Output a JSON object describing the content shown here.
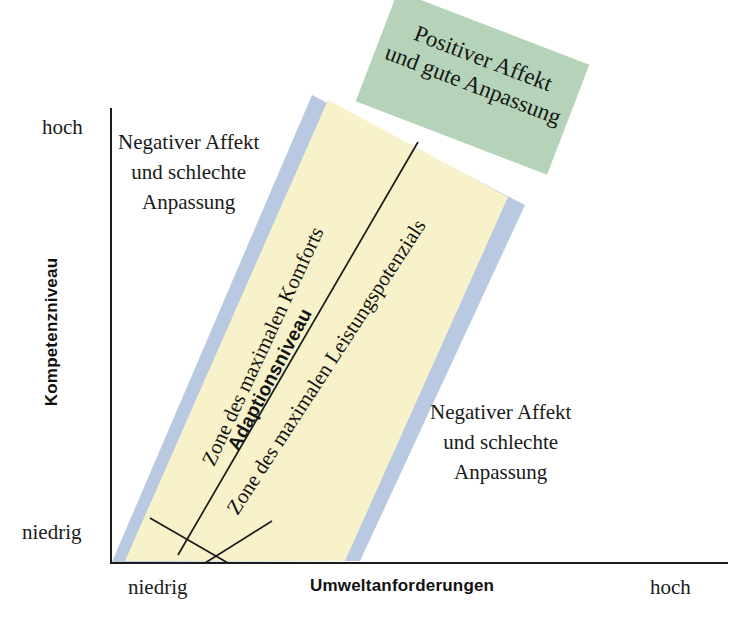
{
  "figure": {
    "axes": {
      "y": {
        "title": "Kompetenzniveau",
        "low_label": "niedrig",
        "high_label": "hoch"
      },
      "x": {
        "title": "Umweltanforderungen",
        "low_label": "niedrig",
        "high_label": "hoch"
      }
    },
    "regions": {
      "top_left": {
        "line1": "Negativer Affekt",
        "line2": "und schlechte",
        "line3": "Anpassung"
      },
      "bottom_right": {
        "line1": "Negativer Affekt",
        "line2": "und schlechte",
        "line3": "Anpassung"
      },
      "callout_green": {
        "line1": "Positiver Affekt",
        "line2": "und gute Anpassung"
      }
    },
    "bands": {
      "comfort": "Zone des maximalen Komforts",
      "performance": "Zone des maximalen Leistungspotenzials",
      "adaptation": "Adaptionsniveau"
    },
    "colors": {
      "yellow_band": "#f7f2c9",
      "blue_band": "#b9c9e2",
      "green_box": "#b5d3b8",
      "axis_line": "#1c1c1c",
      "text": "#161616"
    }
  }
}
